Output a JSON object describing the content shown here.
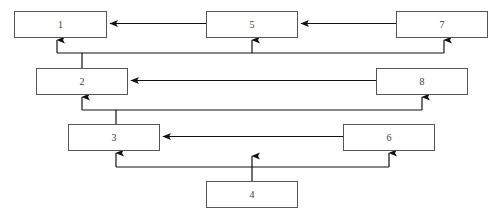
{
  "diagram": {
    "type": "block-flow-diagram",
    "orientation": "v-shaped-hierarchy",
    "background_color": "#ffffff",
    "box_border_color": "#555555",
    "box_fill_color": "#ffffff",
    "line_color": "#1a1a1a",
    "nodes": [
      {
        "id": "node-1",
        "label": "1",
        "x": 14,
        "y": 11,
        "w": 93,
        "h": 27,
        "row": 1,
        "column": "left"
      },
      {
        "id": "node-5",
        "label": "5",
        "x": 206,
        "y": 11,
        "w": 92,
        "h": 27,
        "row": 1,
        "column": "center"
      },
      {
        "id": "node-7",
        "label": "7",
        "x": 396,
        "y": 11,
        "w": 92,
        "h": 27,
        "row": 1,
        "column": "right"
      },
      {
        "id": "node-2",
        "label": "2",
        "x": 36,
        "y": 68,
        "w": 92,
        "h": 27,
        "row": 2,
        "column": "left"
      },
      {
        "id": "node-8",
        "label": "8",
        "x": 376,
        "y": 68,
        "w": 92,
        "h": 27,
        "row": 2,
        "column": "right"
      },
      {
        "id": "node-3",
        "label": "3",
        "x": 68,
        "y": 124,
        "w": 92,
        "h": 27,
        "row": 3,
        "column": "left"
      },
      {
        "id": "node-6",
        "label": "6",
        "x": 343,
        "y": 124,
        "w": 92,
        "h": 27,
        "row": 3,
        "column": "right"
      },
      {
        "id": "node-4",
        "label": "4",
        "x": 206,
        "y": 181,
        "w": 92,
        "h": 27,
        "row": 4,
        "column": "center"
      }
    ],
    "connectors": [
      {
        "id": "conn-1-5",
        "from": "node-1",
        "to": "node-5",
        "style": "double-arrow-horizontal"
      },
      {
        "id": "conn-5-7",
        "from": "node-5",
        "to": "node-7",
        "style": "double-arrow-horizontal"
      },
      {
        "id": "conn-2-8",
        "from": "node-2",
        "to": "node-8",
        "style": "double-arrow-horizontal"
      },
      {
        "id": "conn-3-6",
        "from": "node-3",
        "to": "node-6",
        "style": "double-arrow-horizontal"
      },
      {
        "id": "conn-row2-row1",
        "from": "node-2",
        "to": [
          "node-1",
          "node-5",
          "node-7"
        ],
        "style": "bracket-up"
      },
      {
        "id": "conn-row3-row2",
        "from": "node-3",
        "to": [
          "node-2",
          "node-8"
        ],
        "style": "bracket-up"
      },
      {
        "id": "conn-row4-row3",
        "from": "node-4",
        "to": [
          "node-3",
          "node-6"
        ],
        "style": "bracket-up"
      }
    ]
  }
}
